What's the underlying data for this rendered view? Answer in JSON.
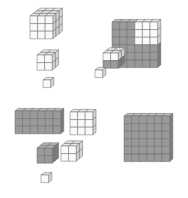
{
  "figure": {
    "colors": {
      "white_front": "#fafafa",
      "white_top": "#e8e8e8",
      "white_side": "#d4d4d4",
      "gray_front": "#9a9a9a",
      "gray_top": "#b8b8b8",
      "gray_side": "#7c7c7c",
      "edge": "#6a6a6a"
    },
    "panels": [
      {
        "id": "top-left",
        "groups": [
          {
            "shape": "cube",
            "cols": 3,
            "rows": 3,
            "depth": 3,
            "shading": "white",
            "x": 30,
            "y": 16
          },
          {
            "shape": "cube",
            "cols": 2,
            "rows": 2,
            "depth": 2,
            "shading": "white",
            "x": 37,
            "y": 55
          },
          {
            "shape": "cube",
            "cols": 1,
            "rows": 1,
            "depth": 1,
            "shading": "white",
            "x": 43,
            "y": 80
          }
        ]
      },
      {
        "id": "top-right",
        "groups": [
          {
            "shape": "slab",
            "cols": 6,
            "rows": 6,
            "depth": 1,
            "shading": "mixed-white-upper-right",
            "x": 112,
            "y": 22
          },
          {
            "shape": "cube",
            "cols": 2,
            "rows": 2,
            "depth": 2,
            "shading": "mixed",
            "x": 103,
            "y": 53
          },
          {
            "shape": "cube",
            "cols": 1,
            "rows": 1,
            "depth": 1,
            "shading": "white",
            "x": 95,
            "y": 70
          }
        ]
      },
      {
        "id": "bottom-left",
        "groups": [
          {
            "shape": "slab",
            "cols": 6,
            "rows": 3,
            "depth": 1,
            "shading": "gray",
            "x": 15,
            "y": 111
          },
          {
            "shape": "slab",
            "cols": 3,
            "rows": 3,
            "depth": 1,
            "shading": "white",
            "x": 70,
            "y": 112
          },
          {
            "shape": "cube",
            "cols": 2,
            "rows": 2,
            "depth": 2,
            "shading": "gray",
            "x": 37,
            "y": 148
          },
          {
            "shape": "cube",
            "cols": 2,
            "rows": 2,
            "depth": 2,
            "shading": "white",
            "x": 61,
            "y": 146
          },
          {
            "shape": "cube",
            "cols": 1,
            "rows": 1,
            "depth": 1,
            "shading": "white",
            "x": 41,
            "y": 175
          }
        ]
      },
      {
        "id": "bottom-right",
        "groups": [
          {
            "shape": "slab",
            "cols": 6,
            "rows": 6,
            "depth": 1,
            "shading": "gray",
            "x": 124,
            "y": 116
          }
        ]
      }
    ]
  }
}
